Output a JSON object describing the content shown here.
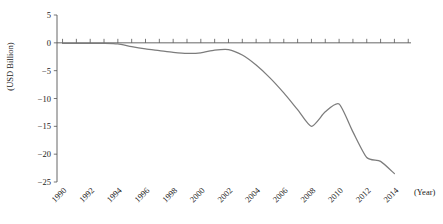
{
  "chart_data": {
    "type": "line",
    "title": "",
    "xlabel": "(Year)",
    "ylabel": "(USD Billion)",
    "x": [
      1990,
      1991,
      1992,
      1993,
      1994,
      1995,
      1996,
      1997,
      1998,
      1999,
      2000,
      2001,
      2002,
      2003,
      2004,
      2005,
      2006,
      2007,
      2008,
      2009,
      2010,
      2011,
      2012,
      2013,
      2014
    ],
    "series": [
      {
        "name": "Balance",
        "values": [
          -0.1,
          -0.1,
          -0.1,
          -0.1,
          -0.2,
          -0.7,
          -1.1,
          -1.4,
          -1.7,
          -1.9,
          -1.8,
          -1.3,
          -1.2,
          -2.2,
          -4.0,
          -6.3,
          -9.0,
          -12.0,
          -15.0,
          -12.4,
          -11.0,
          -16.0,
          -20.6,
          -21.3,
          -23.5
        ]
      }
    ],
    "xlim": [
      1989.6,
      2015.2
    ],
    "ylim": [
      -25,
      5
    ],
    "xticks": [
      1990,
      1991,
      1992,
      1993,
      1994,
      1995,
      1996,
      1997,
      1998,
      1999,
      2000,
      2001,
      2002,
      2003,
      2004,
      2005,
      2006,
      2007,
      2008,
      2009,
      2010,
      2011,
      2012,
      2013,
      2014,
      2015
    ],
    "xtick_labels": [
      "1990",
      "",
      "1992",
      "",
      "1994",
      "",
      "1996",
      "",
      "1998",
      "",
      "2000",
      "",
      "2002",
      "",
      "2004",
      "",
      "2006",
      "",
      "2008",
      "",
      "2010",
      "",
      "2012",
      "",
      "2014",
      ""
    ],
    "yticks": [
      5,
      0,
      -5,
      -10,
      -15,
      -20,
      -25
    ],
    "ytick_labels": [
      "5",
      "0",
      "-5",
      "-10",
      "-15",
      "-20",
      "-25"
    ],
    "grid": false,
    "legend": null,
    "line_color": "#7c7c7c",
    "axis_color": "#555555"
  },
  "axis": {
    "y_unit_label": "(USD Billion)",
    "x_unit_label": "(Year)"
  }
}
